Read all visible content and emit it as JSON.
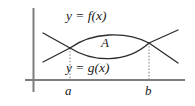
{
  "figure": {
    "background_color": "#ffffff",
    "axis_color": "#7d7d7d",
    "curve_color": "#2b2b2b",
    "guide_color": "#8c8c8c",
    "text_color": "#1a1a1a",
    "labels": {
      "upper_curve": "y = f(x)",
      "lower_curve": "y = g(x)",
      "region": "A",
      "left_bound": "a",
      "right_bound": "b"
    }
  },
  "chart_data": {
    "type": "line",
    "xlabel": "",
    "ylabel": "",
    "grid": false,
    "legend": "inline-annotations",
    "axes": {
      "x_axis": {
        "y_pixel": 80,
        "x_start": 25,
        "x_end": 185,
        "color": "#7d7d7d"
      },
      "y_axis": {
        "x_pixel": 33,
        "y_start": 8,
        "y_end": 92,
        "color": "#7d7d7d"
      }
    },
    "annotations": [
      {
        "text": "y = f(x)",
        "x": 66,
        "y": 9,
        "role": "upper-curve-label"
      },
      {
        "text": "A",
        "x": 101,
        "y": 36,
        "role": "region-label"
      },
      {
        "text": "y = g(x)",
        "x": 66,
        "y": 61,
        "role": "lower-curve-label"
      },
      {
        "text": "a",
        "x": 65,
        "y": 84,
        "role": "left-bound-tick-label"
      },
      {
        "text": "b",
        "x": 145,
        "y": 84,
        "role": "right-bound-tick-label"
      }
    ],
    "intersections": [
      {
        "name": "a",
        "x": 70,
        "y": 48
      },
      {
        "name": "b",
        "x": 149,
        "y": 43
      }
    ],
    "guides": [
      {
        "name": "a",
        "x": 70,
        "y_top": 48,
        "y_bottom": 80,
        "style": "dotted"
      },
      {
        "name": "b",
        "x": 149,
        "y_top": 43,
        "y_bottom": 80,
        "style": "dotted"
      }
    ],
    "series": [
      {
        "name": "y = f(x)",
        "role": "upper",
        "path": "M 43,62 L 70,48 C 92,32 126,31 149,43 L 178,30",
        "points": [
          [
            43,
            62
          ],
          [
            70,
            48
          ],
          [
            105,
            33
          ],
          [
            130,
            34
          ],
          [
            149,
            43
          ],
          [
            178,
            30
          ]
        ]
      },
      {
        "name": "y = g(x)",
        "role": "lower",
        "path": "M 43,33 L 70,48 C 92,62 126,64 149,43 L 178,63",
        "points": [
          [
            43,
            33
          ],
          [
            70,
            48
          ],
          [
            105,
            60
          ],
          [
            130,
            59
          ],
          [
            149,
            43
          ],
          [
            178,
            63
          ]
        ]
      }
    ],
    "region": {
      "name": "A",
      "description": "Area enclosed between f(x) above and g(x) below, from x = a to x = b",
      "path": "M 70,48 C 92,32 126,31 149,43 C 126,64 92,62 70,48 Z"
    }
  }
}
